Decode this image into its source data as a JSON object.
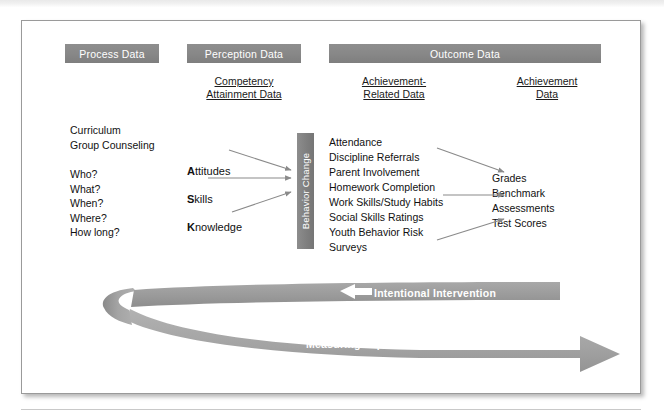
{
  "figure": {
    "header_bars": [
      {
        "id": "process",
        "label": "Process Data"
      },
      {
        "id": "perception",
        "label": "Perception Data"
      },
      {
        "id": "outcome",
        "label": "Outcome Data"
      }
    ],
    "column_headers": {
      "competency": {
        "line1": "Competency",
        "line2": "Attainment Data"
      },
      "ach_related": {
        "line1": "Achievement-",
        "line2": "Related Data"
      },
      "achievement": {
        "line1": "Achievement",
        "line2": "Data"
      }
    },
    "process_column": {
      "group_a": "Curriculum\nGroup Counseling",
      "group_b": "Who?\nWhat?\nWhen?\nWhere?\nHow long?"
    },
    "competency_column": {
      "attitudes": {
        "initial": "A",
        "rest": "ttitudes"
      },
      "skills": {
        "initial": "S",
        "rest": "kills"
      },
      "knowledge": {
        "initial": "K",
        "rest": "nowledge"
      }
    },
    "behavior_bar": {
      "label": "Behavior Change"
    },
    "achievement_related_items": "Attendance\nDiscipline Referrals\nParent Involvement\nHomework Completion\nWork Skills/Study Habits\nSocial Skills Ratings\nYouth Behavior Risk\nSurveys",
    "achievement_items": "Grades\nBenchmark\nAssessments\nTest Scores",
    "ribbon": {
      "top_label": "Intentional Intervention",
      "bottom_label": "Measuring Impact of Intervention"
    },
    "colors": {
      "bar_gray": "#858585",
      "ribbon_gray": "#9a9a9a",
      "arrow_gray": "#8a8a8a",
      "text": "#111111",
      "frame_border": "#9a9a9a"
    }
  }
}
